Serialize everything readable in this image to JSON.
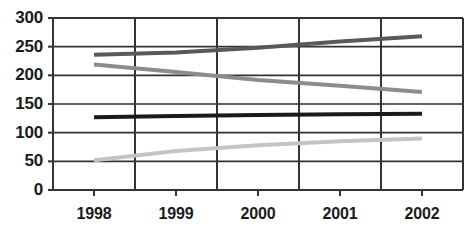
{
  "chart_data": {
    "type": "line",
    "title": "",
    "subtitle": "",
    "xlabel": "",
    "ylabel": "",
    "categories": [
      "1998",
      "1999",
      "2000",
      "2001",
      "2002"
    ],
    "xtick_labels": [
      "1998",
      "1999",
      "2000",
      "2001",
      "2002"
    ],
    "ytick_labels": [
      "300",
      "250",
      "200",
      "150",
      "100",
      "50",
      "0"
    ],
    "ytick_values": [
      300,
      250,
      200,
      150,
      100,
      50,
      0
    ],
    "ylim": [
      0,
      300
    ],
    "grid": "both",
    "legend": "none",
    "series": [
      {
        "name": "series-dark-gray-rising",
        "color": "#595959",
        "values": [
          236,
          240,
          248,
          259,
          268
        ]
      },
      {
        "name": "series-medium-gray-falling",
        "color": "#8c8c8c",
        "values": [
          219,
          206,
          192,
          182,
          171
        ]
      },
      {
        "name": "series-black-flat",
        "color": "#1a1a1a",
        "values": [
          127,
          129,
          131,
          132,
          133
        ]
      },
      {
        "name": "series-light-gray-rising",
        "color": "#c4c4c4",
        "values": [
          52,
          68,
          78,
          85,
          90
        ]
      }
    ]
  },
  "axes": {
    "frame_color": "#333333",
    "gridline_color": "#333333"
  }
}
